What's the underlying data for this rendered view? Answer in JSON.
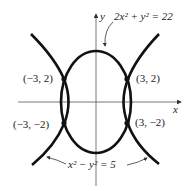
{
  "figure": {
    "axes": {
      "x_label": "x",
      "y_label": "y"
    },
    "curves": [
      {
        "name": "ellipse",
        "equation": "2x² + y² = 22"
      },
      {
        "name": "hyperbola",
        "equation": "x² − y² = 5"
      }
    ],
    "points": [
      {
        "label": "(−3, 2)",
        "x": -3,
        "y": 2
      },
      {
        "label": "(3, 2)",
        "x": 3,
        "y": 2
      },
      {
        "label": "(−3, −2)",
        "x": -3,
        "y": -2
      },
      {
        "label": "(3, −2)",
        "x": 3,
        "y": -2
      }
    ],
    "colors": {
      "curve": "#111111",
      "axis": "#555555",
      "text": "#222222"
    }
  }
}
